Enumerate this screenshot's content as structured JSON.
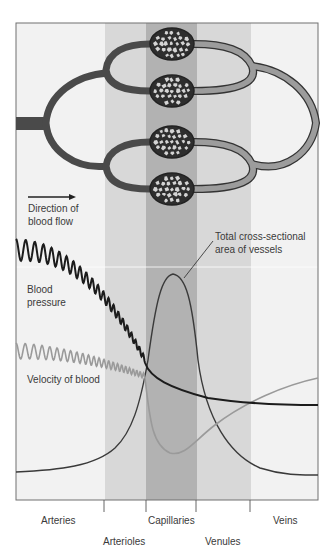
{
  "figure": {
    "regions": [
      {
        "name": "Arteries",
        "x0": 16,
        "x1": 105,
        "fill": "#f2f2f2"
      },
      {
        "name": "Arterioles",
        "x0": 105,
        "x1": 146,
        "fill": "#d8d8d8"
      },
      {
        "name": "Capillaries",
        "x0": 146,
        "x1": 197,
        "fill": "#b2b2b2"
      },
      {
        "name": "Venules",
        "x0": 197,
        "x1": 251,
        "fill": "#d8d8d8"
      },
      {
        "name": "Veins",
        "x0": 251,
        "x1": 318,
        "fill": "#f2f2f2"
      }
    ],
    "colors": {
      "artery_vessel": "#4a4a4a",
      "vein_vessel": "#9c9c9c",
      "vessel_outline": "#333333",
      "pressure_line": "#1c1c1c",
      "velocity_line": "#9a9a9a",
      "area_line": "#3a3a3a"
    },
    "labels": {
      "direction_line1": "Direction of",
      "direction_line2": "blood flow",
      "area_line1": "Total cross-sectional",
      "area_line2": "area of vessels",
      "pressure_line1": "Blood",
      "pressure_line2": "pressure",
      "velocity": "Velocity of blood"
    },
    "axis_labels": {
      "arteries": "Arteries",
      "arterioles": "Arterioles",
      "capillaries": "Capillaries",
      "venules": "Venules",
      "veins": "Veins"
    }
  },
  "chart_data": {
    "type": "line",
    "title": "",
    "xlabel": "",
    "ylabel": "",
    "categories": [
      "Arteries",
      "Arterioles",
      "Capillaries",
      "Venules",
      "Veins"
    ],
    "series": [
      {
        "name": "Blood pressure",
        "values": [
          0.9,
          0.55,
          0.2,
          0.12,
          0.1
        ],
        "note": "pulsatile in arteries/arterioles, smooth after capillaries"
      },
      {
        "name": "Velocity of blood",
        "values": [
          0.45,
          0.35,
          0.05,
          0.25,
          0.45
        ],
        "note": "pulsatile in arteries, minimum in capillaries"
      },
      {
        "name": "Total cross-sectional area of vessels",
        "values": [
          0.05,
          0.2,
          1.0,
          0.3,
          0.05
        ],
        "note": "peaks in capillaries"
      }
    ],
    "grid": false,
    "legend": "inline labels"
  }
}
